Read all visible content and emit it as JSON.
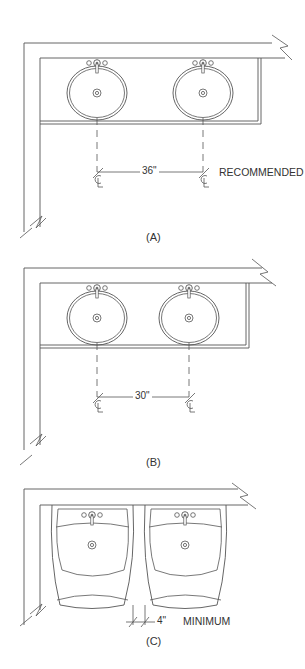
{
  "diagrams": [
    {
      "id": "A",
      "caption": "(A)",
      "dimension": "36\"",
      "note": "RECOMMENDED",
      "centerline_symbol": "CL",
      "sink_type": "oval countertop lavatory",
      "sink_count": 2
    },
    {
      "id": "B",
      "caption": "(B)",
      "dimension": "30\"",
      "note": "",
      "centerline_symbol": "CL",
      "sink_type": "oval countertop lavatory",
      "sink_count": 2
    },
    {
      "id": "C",
      "caption": "(C)",
      "dimension": "4\"",
      "note": "MINIMUM",
      "sink_type": "wall-hung pedestal lavatory",
      "sink_count": 2
    }
  ],
  "colors": {
    "line": "#555555",
    "text": "#333333",
    "background": "#ffffff"
  }
}
